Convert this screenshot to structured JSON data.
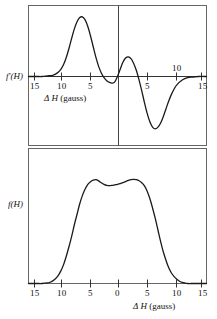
{
  "figure": {
    "background": "#ffffff",
    "line_color": "#1a1a1a",
    "frame_color": "#555555"
  },
  "panels": {
    "top": {
      "name": "derivative-spectrum-panel",
      "ylabel": "f′(H)",
      "xlabel_delta": "Δ",
      "xlabel_h": "H",
      "xlabel_units": "(gauss)",
      "xlabel_full": "Δ H (gauss)",
      "left_ticks": [
        "15",
        "10",
        "5"
      ],
      "right_ticks": [
        "5",
        "10",
        "15"
      ]
    },
    "bottom": {
      "name": "absorption-spectrum-panel",
      "ylabel": "f(H)",
      "xlabel_delta": "Δ",
      "xlabel_h": "H",
      "xlabel_units": "(gauss)",
      "xlabel_full": "Δ H (gauss)",
      "ticks": [
        "15",
        "10",
        "5",
        "0",
        "5",
        "10",
        "15"
      ]
    }
  },
  "chart_data": [
    {
      "type": "line",
      "name": "derivative-lineshape",
      "title": "",
      "xlabel": "Δ H (gauss)",
      "ylabel": "f′(H)",
      "xlim": [
        -16.5,
        16.5
      ],
      "ylim": [
        -1.15,
        1.15
      ],
      "xticks": [
        -15,
        -10,
        -5,
        0,
        5,
        10,
        15
      ],
      "xticklabels": [
        "15",
        "10",
        "5",
        "0",
        "5",
        "10",
        "15"
      ],
      "grid": false,
      "legend": null,
      "x": [
        -16.5,
        -15,
        -14,
        -13,
        -12,
        -11.5,
        -11,
        -10.5,
        -10,
        -9.5,
        -9,
        -8.5,
        -8,
        -7.5,
        -7,
        -6.5,
        -6,
        -5.5,
        -5,
        -4.5,
        -4,
        -3.5,
        -3,
        -2.5,
        -2,
        -1.5,
        -1,
        -0.5,
        0,
        0.5,
        1,
        1.5,
        2,
        2.5,
        3,
        3.5,
        4,
        4.5,
        5,
        5.5,
        6,
        6.5,
        7,
        7.5,
        8,
        8.5,
        9,
        9.5,
        10,
        10.5,
        11,
        12,
        13,
        14,
        15,
        16.5
      ],
      "y": [
        0.0,
        0.0,
        0.0,
        0.01,
        0.02,
        0.04,
        0.07,
        0.12,
        0.2,
        0.32,
        0.47,
        0.64,
        0.8,
        0.92,
        0.99,
        1.0,
        0.95,
        0.84,
        0.68,
        0.5,
        0.32,
        0.17,
        0.06,
        -0.02,
        -0.07,
        -0.1,
        -0.11,
        -0.09,
        0.0,
        0.12,
        0.24,
        0.31,
        0.33,
        0.3,
        0.22,
        0.1,
        -0.06,
        -0.24,
        -0.44,
        -0.62,
        -0.76,
        -0.85,
        -0.88,
        -0.85,
        -0.78,
        -0.67,
        -0.54,
        -0.41,
        -0.3,
        -0.21,
        -0.14,
        -0.06,
        -0.02,
        -0.01,
        0.0,
        0.0
      ]
    },
    {
      "type": "line",
      "name": "absorption-lineshape",
      "title": "",
      "xlabel": "Δ H (gauss)",
      "ylabel": "f(H)",
      "xlim": [
        -16.5,
        16.5
      ],
      "ylim": [
        0,
        1.12
      ],
      "xticks": [
        -15,
        -10,
        -5,
        0,
        5,
        10,
        15
      ],
      "xticklabels": [
        "15",
        "10",
        "5",
        "0",
        "5",
        "10",
        "15"
      ],
      "grid": false,
      "legend": null,
      "x": [
        -16.5,
        -15,
        -14,
        -13,
        -12.5,
        -12,
        -11.5,
        -11,
        -10.5,
        -10,
        -9.5,
        -9,
        -8.5,
        -8,
        -7.5,
        -7,
        -6.5,
        -6,
        -5.5,
        -5,
        -4.5,
        -4,
        -3.5,
        -3,
        -2.5,
        -2,
        -1.5,
        -1,
        -0.5,
        0,
        0.5,
        1,
        1.5,
        2,
        2.5,
        3,
        3.5,
        4,
        4.5,
        5,
        5.5,
        6,
        6.5,
        7,
        7.5,
        8,
        8.5,
        9,
        9.5,
        10,
        10.5,
        11,
        11.5,
        12,
        12.5,
        13,
        14,
        15,
        16.5
      ],
      "y": [
        0.0,
        0.0,
        0.0,
        0.005,
        0.012,
        0.025,
        0.045,
        0.075,
        0.12,
        0.18,
        0.26,
        0.35,
        0.45,
        0.56,
        0.66,
        0.76,
        0.84,
        0.9,
        0.945,
        0.97,
        0.985,
        0.99,
        0.978,
        0.96,
        0.945,
        0.935,
        0.932,
        0.935,
        0.94,
        0.945,
        0.952,
        0.962,
        0.972,
        0.982,
        0.99,
        0.993,
        0.99,
        0.98,
        0.96,
        0.93,
        0.88,
        0.81,
        0.72,
        0.62,
        0.51,
        0.4,
        0.3,
        0.22,
        0.15,
        0.1,
        0.065,
        0.04,
        0.022,
        0.01,
        0.004,
        0.0,
        0.0,
        0.0,
        0.0
      ]
    }
  ]
}
